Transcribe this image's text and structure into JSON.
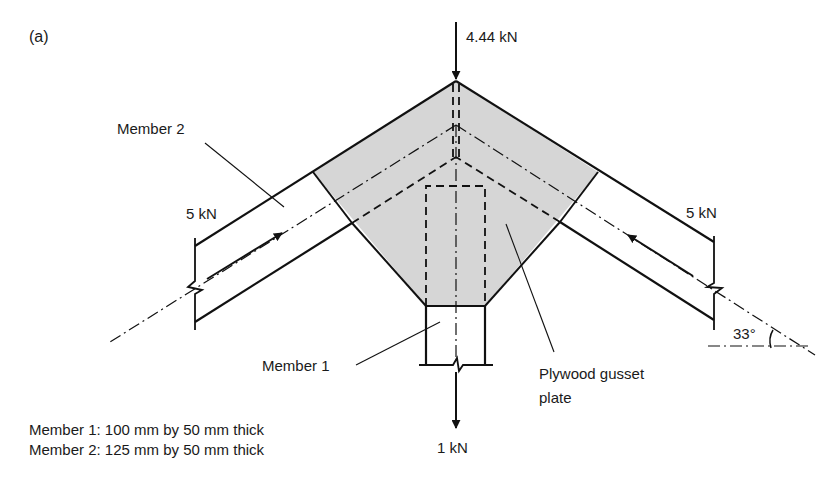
{
  "figure": {
    "panel_label": "(a)",
    "colors": {
      "line": "#111111",
      "gusset_fill": "#d6d6d6",
      "background": "#ffffff"
    }
  },
  "loads": {
    "top": "4.44 kN",
    "left": "5 kN",
    "right": "5 kN",
    "bottom": "1 kN"
  },
  "labels": {
    "member_2": "Member 2",
    "member_1": "Member 1",
    "gusset": "Plywood gusset plate",
    "gusset_line1": "Plywood gusset",
    "gusset_line2": "plate",
    "angle": "33°"
  },
  "notes": [
    "Member 1: 100 mm by 50 mm thick",
    "Member 2: 125 mm by 50 mm thick"
  ],
  "geometry": {
    "member_2_angle_deg": 33
  }
}
